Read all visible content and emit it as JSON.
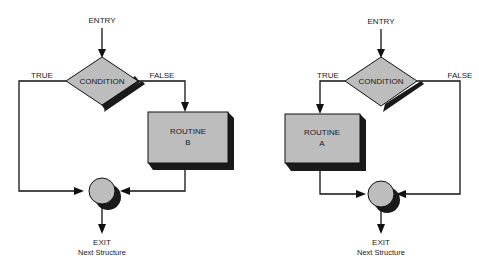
{
  "diagrams": [
    {
      "name": "left-structure",
      "entry_label": "ENTRY",
      "condition_label": "CONDITION",
      "true_label": "TRUE",
      "false_label": "FALSE",
      "routine_line1": "ROUTINE",
      "routine_line2": "B",
      "routine_branch": "false",
      "exit_line1": "EXIT",
      "exit_line2": "Next Structure"
    },
    {
      "name": "right-structure",
      "entry_label": "ENTRY",
      "condition_label": "CONDITION",
      "true_label": "TRUE",
      "false_label": "FALSE",
      "routine_line1": "ROUTINE",
      "routine_line2": "A",
      "routine_branch": "true",
      "exit_line1": "EXIT",
      "exit_line2": "Next Structure"
    }
  ],
  "colors": {
    "shape_fill": "#bdbdbd",
    "shadow": "#1a1a1a",
    "line": "#111111"
  }
}
